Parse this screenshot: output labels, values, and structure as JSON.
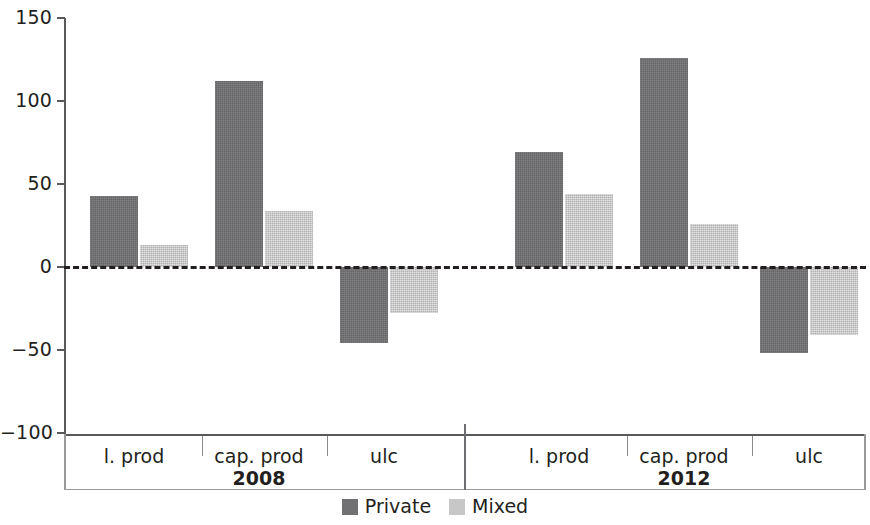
{
  "chart_data": {
    "type": "bar",
    "title": "",
    "subtitle": "",
    "xlabel": "",
    "ylabel": "",
    "ylim": [
      -100,
      150
    ],
    "yticks": [
      150,
      100,
      50,
      0,
      -50,
      -100
    ],
    "ytick_labels": [
      "150",
      "100",
      "50",
      "0",
      "−100"
    ],
    "grid": false,
    "zero_line": true,
    "legend_position": "bottom-center",
    "categories": [
      "l. prod",
      "cap. prod",
      "ulc"
    ],
    "groups": [
      "2008",
      "2012"
    ],
    "series": [
      {
        "name": "Private",
        "color": "#717073",
        "values_2008": [
          43,
          112,
          -46
        ],
        "values_2012": [
          69,
          126,
          -52
        ]
      },
      {
        "name": "Mixed",
        "color": "#c7c7c7",
        "values_2008": [
          13,
          34,
          -28
        ],
        "values_2012": [
          44,
          26,
          -41
        ]
      }
    ],
    "bars": [
      {
        "group": "2008",
        "category": "l. prod",
        "series": "Private",
        "value": 43
      },
      {
        "group": "2008",
        "category": "l. prod",
        "series": "Mixed",
        "value": 13
      },
      {
        "group": "2008",
        "category": "cap. prod",
        "series": "Private",
        "value": 112
      },
      {
        "group": "2008",
        "category": "cap. prod",
        "series": "Mixed",
        "value": 34
      },
      {
        "group": "2008",
        "category": "ulc",
        "series": "Private",
        "value": -46
      },
      {
        "group": "2008",
        "category": "ulc",
        "series": "Mixed",
        "value": -28
      },
      {
        "group": "2012",
        "category": "l. prod",
        "series": "Private",
        "value": 69
      },
      {
        "group": "2012",
        "category": "l. prod",
        "series": "Mixed",
        "value": 44
      },
      {
        "group": "2012",
        "category": "cap. prod",
        "series": "Private",
        "value": 126
      },
      {
        "group": "2012",
        "category": "cap. prod",
        "series": "Mixed",
        "value": 26
      },
      {
        "group": "2012",
        "category": "ulc",
        "series": "Private",
        "value": -52
      },
      {
        "group": "2012",
        "category": "ulc",
        "series": "Mixed",
        "value": -41
      }
    ]
  },
  "axis": {
    "y_ticks": [
      {
        "label": "150",
        "value": 150
      },
      {
        "label": "100",
        "value": 100
      },
      {
        "label": "50",
        "value": 50
      },
      {
        "label": "0",
        "value": 0
      },
      {
        "label": "−50",
        "value": -50
      },
      {
        "label": "−100",
        "value": -100
      }
    ]
  },
  "x_labels": {
    "categories_2008": [
      "l. prod",
      "cap. prod",
      "ulc"
    ],
    "categories_2012": [
      "l. prod",
      "cap. prod",
      "ulc"
    ],
    "period_left": "2008",
    "period_right": "2012"
  },
  "legend": {
    "items": [
      {
        "label": "Private",
        "color": "#717073"
      },
      {
        "label": "Mixed",
        "color": "#c7c7c7"
      }
    ]
  },
  "colors": {
    "private": "#717073",
    "mixed": "#c7c7c7",
    "axis": "#58595b",
    "text": "#231f20",
    "background": "#ffffff"
  }
}
